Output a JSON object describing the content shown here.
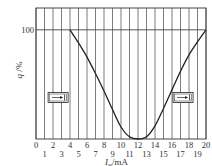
{
  "chart_data": {
    "type": "line",
    "title": "",
    "xlabel": "I_w/mA",
    "xlabel_main": "I",
    "xlabel_sub": "w",
    "xlabel_unit": "/mA",
    "ylabel": "q /%",
    "xlim": [
      0,
      20
    ],
    "ylim": [
      0,
      120
    ],
    "grid": {
      "vertical": true,
      "horizontal_at": [
        100
      ]
    },
    "x_ticks_even": [
      "0",
      "2",
      "4",
      "6",
      "8",
      "10",
      "12",
      "14",
      "16",
      "18",
      "20"
    ],
    "x_ticks_odd": [
      "1",
      "3",
      "5",
      "7",
      "9",
      "11",
      "13",
      "15",
      "17",
      "19"
    ],
    "y_ticks": [
      "100"
    ],
    "series": [
      {
        "name": "q",
        "x": [
          4,
          5,
          6,
          7,
          8,
          9,
          10,
          11,
          12,
          13,
          14,
          15,
          16,
          17,
          18,
          19,
          20
        ],
        "values": [
          100,
          88,
          75,
          60,
          44,
          27,
          11,
          2,
          0,
          2,
          12,
          28,
          45,
          62,
          77,
          89,
          100
        ]
      }
    ],
    "annotations": [
      {
        "name": "valve-left-closed",
        "label": "left valve symbol",
        "x": 2.6,
        "y": 38
      },
      {
        "name": "valve-right-closed",
        "label": "right valve symbol",
        "x": 17.3,
        "y": 38
      }
    ]
  },
  "colors": {
    "line": "#222222",
    "grid": "#444444",
    "background": "#ffffff"
  }
}
